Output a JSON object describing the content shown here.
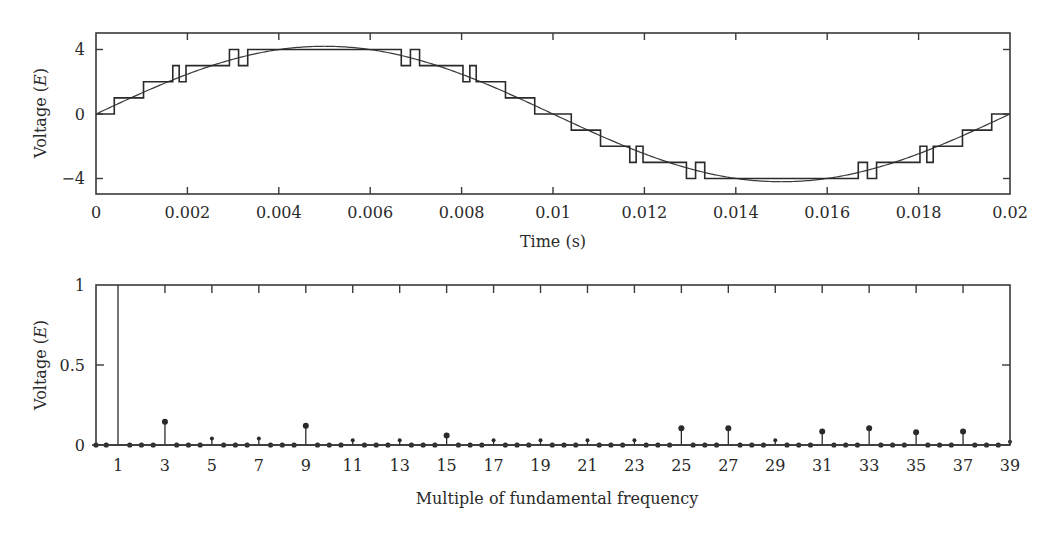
{
  "chart_data": [
    {
      "type": "line",
      "title": "",
      "xlabel": "Time (s)",
      "ylabel": "Voltage (E)",
      "ylabel_parts": {
        "prefix": "Voltage (",
        "italic": "E",
        "suffix": ")"
      },
      "xlim": [
        0,
        0.02
      ],
      "ylim": [
        -5,
        5
      ],
      "xticks": [
        0,
        0.002,
        0.004,
        0.006,
        0.008,
        0.01,
        0.012,
        0.014,
        0.016,
        0.018,
        0.02
      ],
      "xtick_labels": [
        "0",
        "0.002",
        "0.004",
        "0.006",
        "0.008",
        "0.01",
        "0.012",
        "0.014",
        "0.016",
        "0.018",
        "0.02"
      ],
      "yticks": [
        -4,
        0,
        4
      ],
      "ytick_labels": [
        "−4",
        "0",
        "4"
      ],
      "grid": false,
      "legend": null,
      "series": [
        {
          "name": "Reference sine (fundamental)",
          "kind": "sine",
          "amplitude": 4.2,
          "frequency_hz": 50
        },
        {
          "name": "Multilevel staircase output",
          "kind": "step",
          "quarter_wave_breakpoints": [
            {
              "t": 0.0,
              "v": 0
            },
            {
              "t": 0.0004,
              "v": 1
            },
            {
              "t": 0.00104,
              "v": 2
            },
            {
              "t": 0.00168,
              "v": 3
            },
            {
              "t": 0.00182,
              "v": 2
            },
            {
              "t": 0.00197,
              "v": 3
            },
            {
              "t": 0.00292,
              "v": 4
            },
            {
              "t": 0.00312,
              "v": 3
            },
            {
              "t": 0.00332,
              "v": 4
            }
          ],
          "symmetry": "quarter-wave, odd"
        }
      ]
    },
    {
      "type": "bar",
      "style": "stem",
      "title": "",
      "xlabel": "Multiple of fundamental frequency",
      "ylabel": "Voltage (E)",
      "ylabel_parts": {
        "prefix": "Voltage (",
        "italic": "E",
        "suffix": ")"
      },
      "xlim": [
        0,
        39
      ],
      "ylim": [
        0,
        1
      ],
      "xticks": [
        1,
        3,
        5,
        7,
        9,
        11,
        13,
        15,
        17,
        19,
        21,
        23,
        25,
        27,
        29,
        31,
        33,
        35,
        37,
        39
      ],
      "xtick_labels": [
        "1",
        "3",
        "5",
        "7",
        "9",
        "11",
        "13",
        "15",
        "17",
        "19",
        "21",
        "23",
        "25",
        "27",
        "29",
        "31",
        "33",
        "35",
        "37",
        "39"
      ],
      "yticks": [
        0,
        0.5,
        1
      ],
      "ytick_labels": [
        "0",
        "0.5",
        "1"
      ],
      "grid": false,
      "legend": null,
      "categories": [
        "1",
        "3",
        "5",
        "7",
        "9",
        "11",
        "13",
        "15",
        "17",
        "19",
        "21",
        "23",
        "25",
        "27",
        "29",
        "31",
        "33",
        "35",
        "37",
        "39"
      ],
      "values": [
        1.0,
        0.145,
        0.04,
        0.04,
        0.12,
        0.03,
        0.03,
        0.06,
        0.03,
        0.03,
        0.03,
        0.03,
        0.105,
        0.105,
        0.03,
        0.085,
        0.105,
        0.08,
        0.085,
        0.02
      ],
      "zero_dot_positions": [
        0,
        0.5,
        1.5,
        2,
        2.5,
        3.5,
        4,
        4.5,
        5.5,
        6,
        6.5,
        7.5,
        8,
        8.5,
        9.5,
        10,
        10.5,
        11.5,
        12,
        12.5,
        13.5,
        14,
        14.5,
        15.5,
        16,
        16.5,
        17.5,
        18,
        18.5,
        19.5,
        20,
        20.5,
        21.5,
        22,
        22.5,
        23.5,
        24,
        24.5,
        25.5,
        26,
        26.5,
        27.5,
        28,
        28.5,
        29.5,
        30,
        30.5,
        31.5,
        32,
        32.5,
        33.5,
        34,
        34.5,
        35.5,
        36,
        36.5,
        37.5,
        38,
        38.5
      ]
    }
  ]
}
